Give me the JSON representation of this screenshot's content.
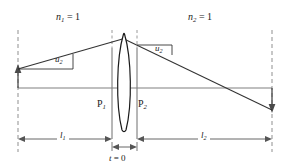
{
  "figure": {
    "colors": {
      "ray": "#333333",
      "axis": "#808080",
      "dashed": "#9a9a9a",
      "lens_outline": "#1a1a1a",
      "lens_fill": "#ffffff",
      "dimension": "#555555",
      "text": "#1a1a1a",
      "background": "#ffffff"
    },
    "labels": {
      "index_left": {
        "symbol": "n",
        "subscript": "1",
        "equals": "=",
        "value": "1",
        "text": "n1 = 1"
      },
      "index_right": {
        "symbol": "n",
        "subscript": "2",
        "equals": "=",
        "value": "1",
        "text": "n2 = 1"
      },
      "angle_left": {
        "symbol": "u",
        "subscript": "2",
        "text": "u2"
      },
      "angle_right": {
        "symbol": "u",
        "subscript": "2",
        "text": "u2"
      },
      "principal_plane_first": {
        "symbol": "P",
        "subscript": "1",
        "text": "P1"
      },
      "principal_plane_second": {
        "symbol": "P",
        "subscript": "2",
        "text": "P2"
      },
      "distance_object": {
        "symbol": "l",
        "subscript": "1",
        "text": "l1"
      },
      "distance_image": {
        "symbol": "l",
        "subscript": "2",
        "text": "l2"
      },
      "thickness": {
        "symbol": "t",
        "equals": "=",
        "value": "0",
        "text": "t = 0"
      }
    },
    "geometry": {
      "optical_axis_y": 88,
      "object_plane_x": 18,
      "lens_center_x": 124,
      "principal_plane_1_x": 112,
      "principal_plane_2_x": 137,
      "image_plane_x": 272,
      "lens_top_y": 33,
      "lens_bottom_y": 131,
      "object_arrow_tip_y": 66,
      "image_arrow_tip_y": 112,
      "dimension_line_y": 139,
      "thickness_value": 0
    }
  }
}
